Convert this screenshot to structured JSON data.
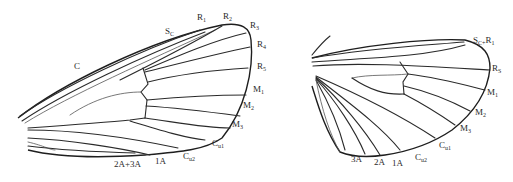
{
  "figure": {
    "type": "insect wing venation diagram",
    "colors": {
      "line": "#2a2a2a",
      "background": "#ffffff"
    }
  },
  "forewing": {
    "labels": [
      {
        "id": "C",
        "main": "C",
        "sub": "",
        "x": 74,
        "y": 62
      },
      {
        "id": "Sc",
        "main": "S",
        "sub": "C",
        "x": 165,
        "y": 27
      },
      {
        "id": "R1",
        "main": "R",
        "sub": "1",
        "x": 197,
        "y": 13
      },
      {
        "id": "R2",
        "main": "R",
        "sub": "2",
        "x": 223,
        "y": 12
      },
      {
        "id": "R3",
        "main": "R",
        "sub": "3",
        "x": 250,
        "y": 21
      },
      {
        "id": "R4",
        "main": "R",
        "sub": "4",
        "x": 257,
        "y": 40
      },
      {
        "id": "R5",
        "main": "R",
        "sub": "5",
        "x": 257,
        "y": 62
      },
      {
        "id": "M1",
        "main": "M",
        "sub": "1",
        "x": 253,
        "y": 85
      },
      {
        "id": "M2",
        "main": "M",
        "sub": "2",
        "x": 243,
        "y": 101
      },
      {
        "id": "M3",
        "main": "M",
        "sub": "3",
        "x": 232,
        "y": 120
      },
      {
        "id": "Cu1",
        "main": "C",
        "sub": "u1",
        "x": 212,
        "y": 139
      },
      {
        "id": "Cu2",
        "main": "C",
        "sub": "u2",
        "x": 183,
        "y": 152
      },
      {
        "id": "1A",
        "main": "1A",
        "sub": "",
        "x": 155,
        "y": 157
      },
      {
        "id": "2A+3A",
        "main": "2A+3A",
        "sub": "",
        "x": 114,
        "y": 160
      }
    ]
  },
  "hindwing": {
    "labels": [
      {
        "id": "Sc+R1",
        "main": "S",
        "sub": "C+",
        "tail": "R",
        "tailsub": "1",
        "x": 473,
        "y": 36
      },
      {
        "id": "Rs",
        "main": "R",
        "sub": "S",
        "x": 492,
        "y": 64
      },
      {
        "id": "M1",
        "main": "M",
        "sub": "1",
        "x": 487,
        "y": 88
      },
      {
        "id": "M2",
        "main": "M",
        "sub": "2",
        "x": 475,
        "y": 108
      },
      {
        "id": "M3",
        "main": "M",
        "sub": "3",
        "x": 460,
        "y": 124
      },
      {
        "id": "Cu1",
        "main": "C",
        "sub": "u1",
        "x": 439,
        "y": 141
      },
      {
        "id": "Cu2",
        "main": "C",
        "sub": "u2",
        "x": 415,
        "y": 153
      },
      {
        "id": "1A",
        "main": "1A",
        "sub": "",
        "x": 392,
        "y": 159
      },
      {
        "id": "2A",
        "main": "2A",
        "sub": "",
        "x": 374,
        "y": 158
      },
      {
        "id": "3A",
        "main": "3A",
        "sub": "",
        "x": 351,
        "y": 155
      }
    ]
  }
}
